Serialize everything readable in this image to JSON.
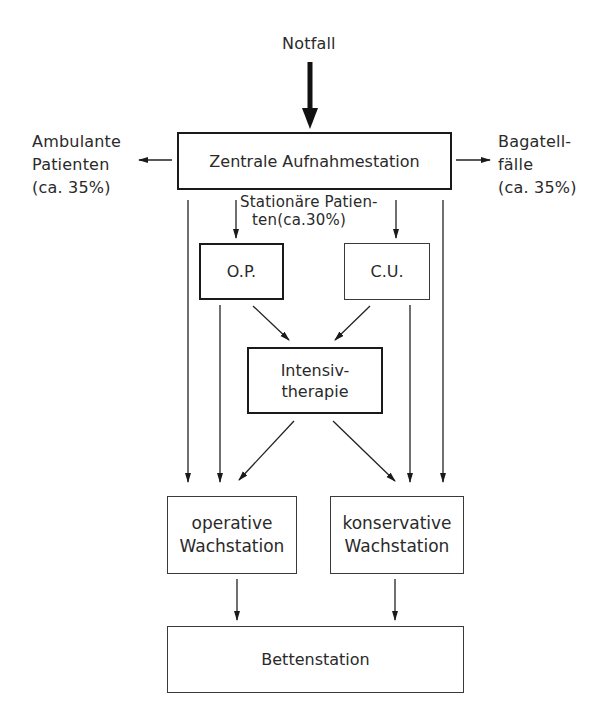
{
  "diagram": {
    "type": "flowchart",
    "language": "de",
    "entry": {
      "label": "Notfall"
    },
    "nodes": {
      "zentrale": {
        "label": "Zentrale Aufnahmestation"
      },
      "op": {
        "label": "O.P."
      },
      "cu": {
        "label": "C.U."
      },
      "intensiv": {
        "line1": "Intensiv-",
        "line2": "therapie"
      },
      "op_wach": {
        "line1": "operative",
        "line2": "Wachstation"
      },
      "kons_wach": {
        "line1": "konservative",
        "line2": "Wachstation"
      },
      "betten": {
        "label": "Bettenstation"
      }
    },
    "side_outputs": {
      "ambulant": {
        "line1": "Ambulante",
        "line2": "Patienten",
        "line3": "(ca. 35%)"
      },
      "bagatell": {
        "line1": "Bagatell-",
        "line2": "fälle",
        "line3": "(ca. 35%)"
      }
    },
    "stationaer": {
      "line1": "Stationäre Patien-",
      "line2": "ten(ca.30%)"
    },
    "edges": [
      {
        "from": "Notfall",
        "to": "Zentrale Aufnahmestation",
        "style": "bold"
      },
      {
        "from": "Zentrale Aufnahmestation",
        "to": "Ambulante Patienten (ca. 35%)"
      },
      {
        "from": "Zentrale Aufnahmestation",
        "to": "Bagatellfälle (ca. 35%)"
      },
      {
        "from": "Zentrale Aufnahmestation",
        "to": "O.P."
      },
      {
        "from": "Zentrale Aufnahmestation",
        "to": "C.U."
      },
      {
        "from": "Zentrale Aufnahmestation",
        "to": "operative Wachstation"
      },
      {
        "from": "Zentrale Aufnahmestation",
        "to": "konservative Wachstation"
      },
      {
        "from": "O.P.",
        "to": "Intensivtherapie"
      },
      {
        "from": "C.U.",
        "to": "Intensivtherapie"
      },
      {
        "from": "O.P.",
        "to": "operative Wachstation"
      },
      {
        "from": "C.U.",
        "to": "konservative Wachstation"
      },
      {
        "from": "Intensivtherapie",
        "to": "operative Wachstation"
      },
      {
        "from": "Intensivtherapie",
        "to": "konservative Wachstation"
      },
      {
        "from": "operative Wachstation",
        "to": "Bettenstation"
      },
      {
        "from": "konservative Wachstation",
        "to": "Bettenstation"
      }
    ]
  }
}
